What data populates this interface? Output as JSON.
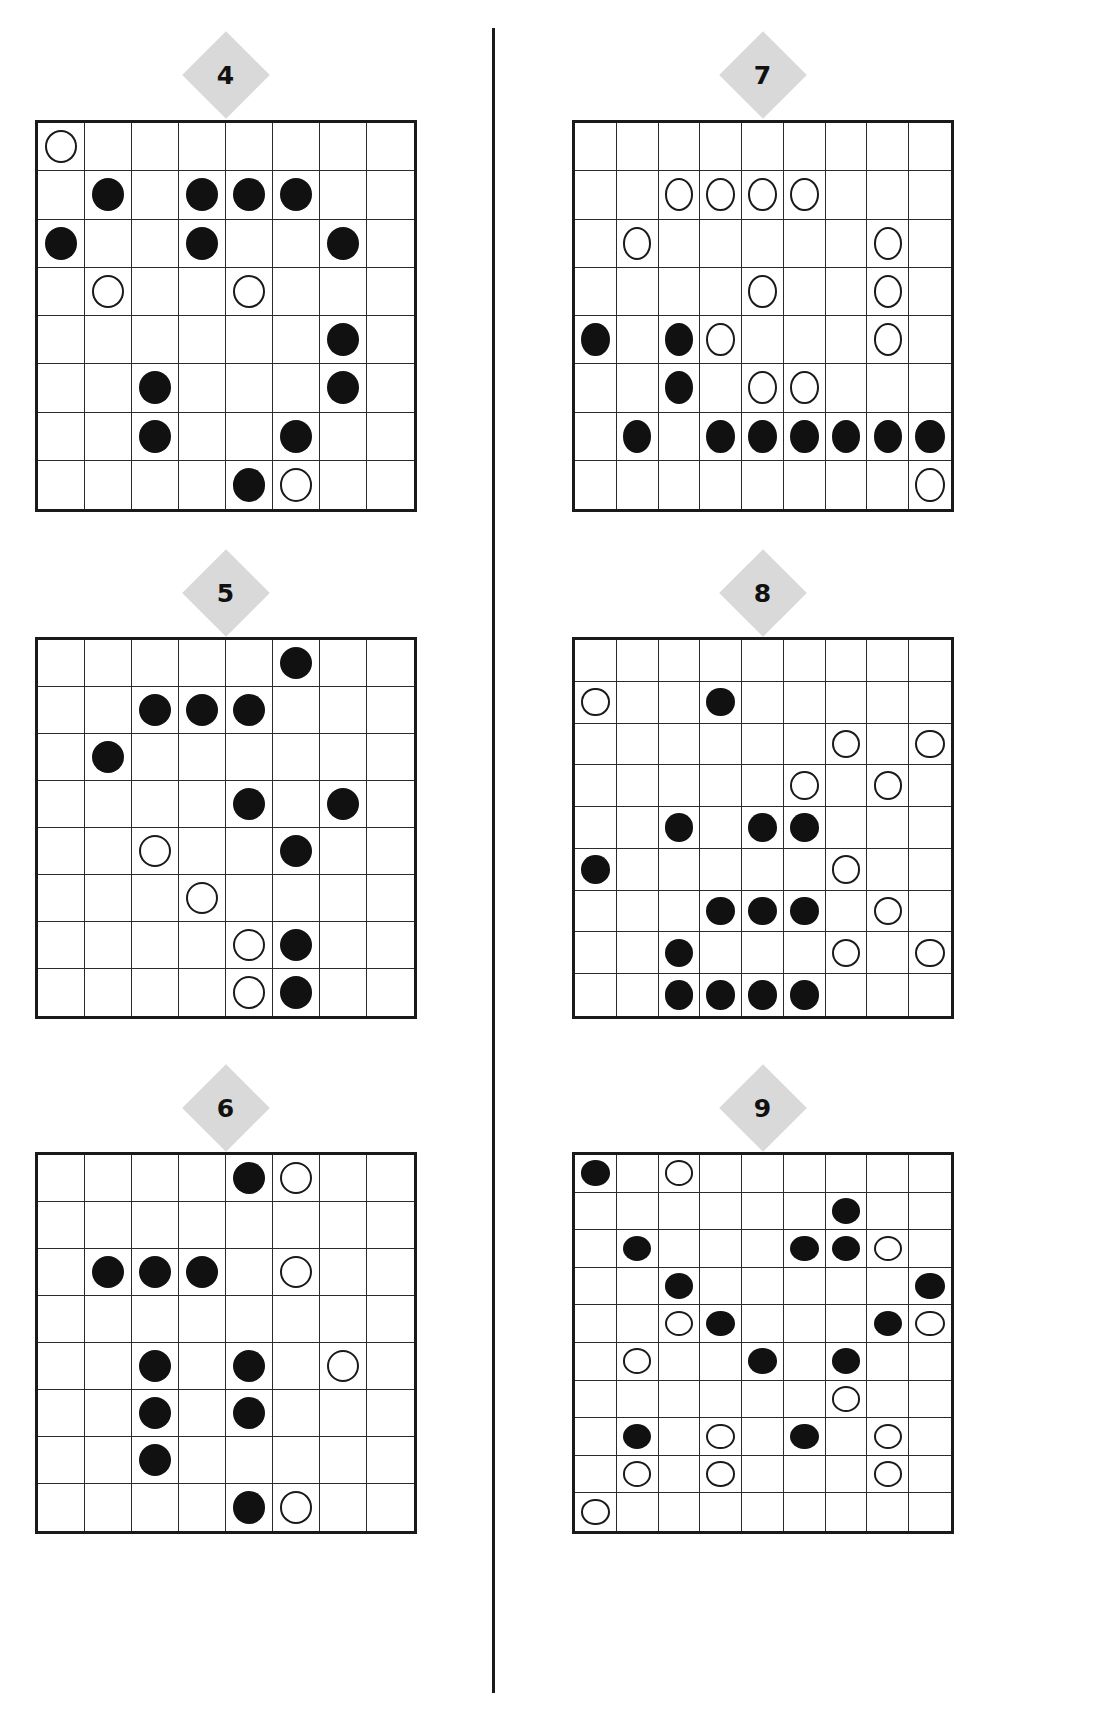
{
  "page": {
    "background": "#ffffff",
    "divider_color": "#1a1a1a",
    "stone_black_color": "#111111",
    "stone_white_color": "#ffffff",
    "badge_color": "#d9d9d9",
    "grid_line_color": "#2b2b2b"
  },
  "puzzles": [
    {
      "label": "4",
      "rows": 8,
      "cols": 8,
      "x": 35,
      "y": 120,
      "w": 382,
      "h": 392,
      "badge_y": 75,
      "stones": [
        {
          "r": 1,
          "c": 1,
          "color": "white"
        },
        {
          "r": 2,
          "c": 2,
          "color": "black"
        },
        {
          "r": 2,
          "c": 4,
          "color": "black"
        },
        {
          "r": 2,
          "c": 5,
          "color": "black"
        },
        {
          "r": 2,
          "c": 6,
          "color": "black"
        },
        {
          "r": 3,
          "c": 1,
          "color": "black"
        },
        {
          "r": 3,
          "c": 4,
          "color": "black"
        },
        {
          "r": 3,
          "c": 7,
          "color": "black"
        },
        {
          "r": 4,
          "c": 2,
          "color": "white"
        },
        {
          "r": 4,
          "c": 5,
          "color": "white"
        },
        {
          "r": 5,
          "c": 7,
          "color": "black"
        },
        {
          "r": 6,
          "c": 3,
          "color": "black"
        },
        {
          "r": 6,
          "c": 7,
          "color": "black"
        },
        {
          "r": 7,
          "c": 3,
          "color": "black"
        },
        {
          "r": 7,
          "c": 6,
          "color": "black"
        },
        {
          "r": 8,
          "c": 5,
          "color": "black"
        },
        {
          "r": 8,
          "c": 6,
          "color": "white"
        }
      ]
    },
    {
      "label": "7",
      "rows": 8,
      "cols": 9,
      "x": 572,
      "y": 120,
      "w": 382,
      "h": 392,
      "badge_y": 75,
      "stones": [
        {
          "r": 2,
          "c": 3,
          "color": "white"
        },
        {
          "r": 2,
          "c": 4,
          "color": "white"
        },
        {
          "r": 2,
          "c": 5,
          "color": "white"
        },
        {
          "r": 2,
          "c": 6,
          "color": "white"
        },
        {
          "r": 3,
          "c": 2,
          "color": "white"
        },
        {
          "r": 3,
          "c": 8,
          "color": "white"
        },
        {
          "r": 4,
          "c": 5,
          "color": "white"
        },
        {
          "r": 4,
          "c": 8,
          "color": "white"
        },
        {
          "r": 5,
          "c": 1,
          "color": "black"
        },
        {
          "r": 5,
          "c": 3,
          "color": "black"
        },
        {
          "r": 5,
          "c": 4,
          "color": "white"
        },
        {
          "r": 5,
          "c": 8,
          "color": "white"
        },
        {
          "r": 6,
          "c": 3,
          "color": "black"
        },
        {
          "r": 6,
          "c": 5,
          "color": "white"
        },
        {
          "r": 6,
          "c": 6,
          "color": "white"
        },
        {
          "r": 7,
          "c": 2,
          "color": "black"
        },
        {
          "r": 7,
          "c": 4,
          "color": "black"
        },
        {
          "r": 7,
          "c": 5,
          "color": "black"
        },
        {
          "r": 7,
          "c": 6,
          "color": "black"
        },
        {
          "r": 7,
          "c": 7,
          "color": "black"
        },
        {
          "r": 7,
          "c": 8,
          "color": "black"
        },
        {
          "r": 7,
          "c": 9,
          "color": "black"
        },
        {
          "r": 8,
          "c": 9,
          "color": "white"
        }
      ]
    },
    {
      "label": "5",
      "rows": 8,
      "cols": 8,
      "x": 35,
      "y": 637,
      "w": 382,
      "h": 382,
      "badge_y": 593,
      "stones": [
        {
          "r": 1,
          "c": 6,
          "color": "black"
        },
        {
          "r": 2,
          "c": 3,
          "color": "black"
        },
        {
          "r": 2,
          "c": 4,
          "color": "black"
        },
        {
          "r": 2,
          "c": 5,
          "color": "black"
        },
        {
          "r": 3,
          "c": 2,
          "color": "black"
        },
        {
          "r": 4,
          "c": 5,
          "color": "black"
        },
        {
          "r": 4,
          "c": 7,
          "color": "black"
        },
        {
          "r": 5,
          "c": 3,
          "color": "white"
        },
        {
          "r": 5,
          "c": 6,
          "color": "black"
        },
        {
          "r": 6,
          "c": 4,
          "color": "white"
        },
        {
          "r": 7,
          "c": 5,
          "color": "white"
        },
        {
          "r": 7,
          "c": 6,
          "color": "black"
        },
        {
          "r": 8,
          "c": 5,
          "color": "white"
        },
        {
          "r": 8,
          "c": 6,
          "color": "black"
        }
      ]
    },
    {
      "label": "8",
      "rows": 9,
      "cols": 9,
      "x": 572,
      "y": 637,
      "w": 382,
      "h": 382,
      "badge_y": 593,
      "stones": [
        {
          "r": 2,
          "c": 1,
          "color": "white"
        },
        {
          "r": 2,
          "c": 4,
          "color": "black"
        },
        {
          "r": 3,
          "c": 7,
          "color": "white"
        },
        {
          "r": 3,
          "c": 9,
          "color": "white"
        },
        {
          "r": 4,
          "c": 6,
          "color": "white"
        },
        {
          "r": 4,
          "c": 8,
          "color": "white"
        },
        {
          "r": 5,
          "c": 3,
          "color": "black"
        },
        {
          "r": 5,
          "c": 5,
          "color": "black"
        },
        {
          "r": 5,
          "c": 6,
          "color": "black"
        },
        {
          "r": 6,
          "c": 1,
          "color": "black"
        },
        {
          "r": 6,
          "c": 7,
          "color": "white"
        },
        {
          "r": 7,
          "c": 4,
          "color": "black"
        },
        {
          "r": 7,
          "c": 5,
          "color": "black"
        },
        {
          "r": 7,
          "c": 6,
          "color": "black"
        },
        {
          "r": 7,
          "c": 8,
          "color": "white"
        },
        {
          "r": 8,
          "c": 3,
          "color": "black"
        },
        {
          "r": 8,
          "c": 7,
          "color": "white"
        },
        {
          "r": 8,
          "c": 9,
          "color": "white"
        },
        {
          "r": 9,
          "c": 3,
          "color": "black"
        },
        {
          "r": 9,
          "c": 4,
          "color": "black"
        },
        {
          "r": 9,
          "c": 5,
          "color": "black"
        },
        {
          "r": 9,
          "c": 6,
          "color": "black"
        }
      ]
    },
    {
      "label": "6",
      "rows": 8,
      "cols": 8,
      "x": 35,
      "y": 1152,
      "w": 382,
      "h": 382,
      "badge_y": 1108,
      "stones": [
        {
          "r": 1,
          "c": 5,
          "color": "black"
        },
        {
          "r": 1,
          "c": 6,
          "color": "white"
        },
        {
          "r": 3,
          "c": 2,
          "color": "black"
        },
        {
          "r": 3,
          "c": 3,
          "color": "black"
        },
        {
          "r": 3,
          "c": 4,
          "color": "black"
        },
        {
          "r": 3,
          "c": 6,
          "color": "white"
        },
        {
          "r": 5,
          "c": 3,
          "color": "black"
        },
        {
          "r": 5,
          "c": 5,
          "color": "black"
        },
        {
          "r": 5,
          "c": 7,
          "color": "white"
        },
        {
          "r": 6,
          "c": 3,
          "color": "black"
        },
        {
          "r": 6,
          "c": 5,
          "color": "black"
        },
        {
          "r": 7,
          "c": 3,
          "color": "black"
        },
        {
          "r": 8,
          "c": 5,
          "color": "black"
        },
        {
          "r": 8,
          "c": 6,
          "color": "white"
        }
      ]
    },
    {
      "label": "9",
      "rows": 10,
      "cols": 9,
      "x": 572,
      "y": 1152,
      "w": 382,
      "h": 382,
      "badge_y": 1108,
      "stones": [
        {
          "r": 1,
          "c": 1,
          "color": "black"
        },
        {
          "r": 1,
          "c": 3,
          "color": "white"
        },
        {
          "r": 2,
          "c": 7,
          "color": "black"
        },
        {
          "r": 3,
          "c": 2,
          "color": "black"
        },
        {
          "r": 3,
          "c": 6,
          "color": "black"
        },
        {
          "r": 3,
          "c": 7,
          "color": "black"
        },
        {
          "r": 3,
          "c": 8,
          "color": "white"
        },
        {
          "r": 4,
          "c": 3,
          "color": "black"
        },
        {
          "r": 4,
          "c": 9,
          "color": "black"
        },
        {
          "r": 5,
          "c": 3,
          "color": "white"
        },
        {
          "r": 5,
          "c": 4,
          "color": "black"
        },
        {
          "r": 5,
          "c": 8,
          "color": "black"
        },
        {
          "r": 5,
          "c": 9,
          "color": "white"
        },
        {
          "r": 6,
          "c": 2,
          "color": "white"
        },
        {
          "r": 6,
          "c": 5,
          "color": "black"
        },
        {
          "r": 6,
          "c": 7,
          "color": "black"
        },
        {
          "r": 7,
          "c": 7,
          "color": "white"
        },
        {
          "r": 8,
          "c": 2,
          "color": "black"
        },
        {
          "r": 8,
          "c": 4,
          "color": "white"
        },
        {
          "r": 8,
          "c": 6,
          "color": "black"
        },
        {
          "r": 8,
          "c": 8,
          "color": "white"
        },
        {
          "r": 9,
          "c": 2,
          "color": "white"
        },
        {
          "r": 9,
          "c": 4,
          "color": "white"
        },
        {
          "r": 9,
          "c": 8,
          "color": "white"
        },
        {
          "r": 10,
          "c": 1,
          "color": "white"
        }
      ]
    }
  ],
  "divider": {
    "x": 492,
    "y": 28,
    "height": 1665
  }
}
